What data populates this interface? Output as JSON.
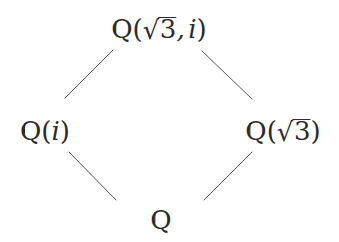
{
  "figure": {
    "kind": "hasse-diagram",
    "caption": "",
    "background_color": "#ffffff",
    "ink_color": "#2b2b2b",
    "width": 339,
    "height": 242
  },
  "nodes": {
    "top": {
      "id": "Q_sqrt3_i",
      "text": "Q(√3, i)",
      "field_symbol": "Q",
      "adjoined": "√3, i",
      "radicand": "3",
      "imaginary_unit": "i",
      "comma": ",",
      "open_paren": "(",
      "close_paren": ")",
      "radical_sign": "√",
      "x": 159,
      "y": 29
    },
    "left": {
      "id": "Q_i",
      "text": "Q(i)",
      "field_symbol": "Q",
      "adjoined": "i",
      "imaginary_unit": "i",
      "open_paren": "(",
      "close_paren": ")",
      "x": 45,
      "y": 131
    },
    "right": {
      "id": "Q_sqrt3",
      "text": "Q(√3)",
      "field_symbol": "Q",
      "adjoined": "√3",
      "radicand": "3",
      "open_paren": "(",
      "close_paren": ")",
      "radical_sign": "√",
      "x": 283,
      "y": 131
    },
    "bottom": {
      "id": "Q",
      "text": "Q",
      "field_symbol": "Q",
      "x": 161,
      "y": 220
    }
  },
  "edges": [
    {
      "id": "edge-top-left",
      "from": "Q_i",
      "to": "Q_sqrt3_i",
      "x1": 65,
      "y1": 98,
      "x2": 113,
      "y2": 50
    },
    {
      "id": "edge-top-right",
      "from": "Q_sqrt3",
      "to": "Q_sqrt3_i",
      "x1": 202,
      "y1": 51,
      "x2": 252,
      "y2": 99
    },
    {
      "id": "edge-bottom-left",
      "from": "Q",
      "to": "Q_i",
      "x1": 69,
      "y1": 152,
      "x2": 116,
      "y2": 200
    },
    {
      "id": "edge-bottom-right",
      "from": "Q",
      "to": "Q_sqrt3",
      "x1": 204,
      "y1": 200,
      "x2": 252,
      "y2": 152
    }
  ],
  "style": {
    "edge_color": "#555555",
    "edge_width": 1,
    "label_font_size_large": 26,
    "label_font_size_small": 26
  }
}
